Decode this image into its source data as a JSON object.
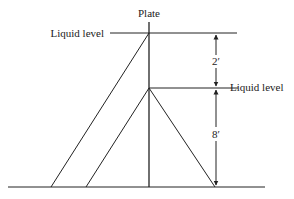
{
  "diagram": {
    "type": "hydrostatic-pressure-on-plate",
    "labels": {
      "plate": "Plate",
      "liquid_level_top": "Liquid level",
      "liquid_level_bottom": "Liquid level"
    },
    "dimensions": {
      "upper": "2′",
      "lower": "8′"
    },
    "colors": {
      "line": "#222222",
      "background": "#ffffff"
    }
  }
}
